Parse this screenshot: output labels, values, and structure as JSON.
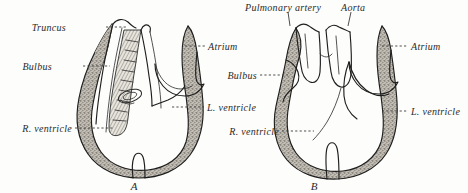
{
  "figure": {
    "background_color": "#fdfdfb",
    "ink_color": "#1e1e1e",
    "wall_fill_color": "#a9a59c",
    "panels": [
      {
        "id": "A",
        "caption": "A",
        "labels": [
          {
            "key": "truncus",
            "text": "Truncus",
            "side": "left"
          },
          {
            "key": "bulbus",
            "text": "Bulbus",
            "side": "left"
          },
          {
            "key": "r_ventricle",
            "text": "R. ventricle",
            "side": "left"
          },
          {
            "key": "atrium",
            "text": "Atrium",
            "side": "right"
          },
          {
            "key": "l_ventricle",
            "text": "L. ventricle",
            "side": "right"
          }
        ]
      },
      {
        "id": "B",
        "caption": "B",
        "labels": [
          {
            "key": "pulmonary_artery",
            "text": "Pulmonary artery",
            "side": "top"
          },
          {
            "key": "aorta",
            "text": "Aorta",
            "side": "top"
          },
          {
            "key": "bulbus",
            "text": "Bulbus",
            "side": "left"
          },
          {
            "key": "r_ventricle",
            "text": "R. ventricle",
            "side": "left"
          },
          {
            "key": "atrium",
            "text": "Atrium",
            "side": "right"
          },
          {
            "key": "l_ventricle",
            "text": "L. ventricle",
            "side": "right"
          }
        ]
      }
    ]
  }
}
